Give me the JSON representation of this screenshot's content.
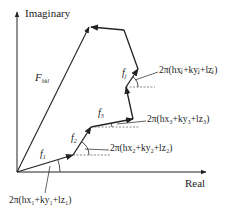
{
  "diagram": {
    "axes": {
      "x_label": "Real",
      "y_label": "Imaginary"
    },
    "resultant": {
      "label": "F",
      "sub": "hkl"
    },
    "vectors": [
      {
        "label": "f",
        "sub": "1",
        "phase": "2π(hx₁+ky₁+lz₁)"
      },
      {
        "label": "f",
        "sub": "2",
        "phase": "2π(hx₂+ky₂+lz₂)"
      },
      {
        "label": "f",
        "sub": "3",
        "phase": "2π(hx₃+ky₃+lz₃)"
      },
      {
        "label": "f",
        "sub": "j",
        "phase": "2π(hxⱼ+kyⱼ+lzⱼ)"
      }
    ],
    "colors": {
      "line": "#222222",
      "dashed": "#555555"
    }
  }
}
